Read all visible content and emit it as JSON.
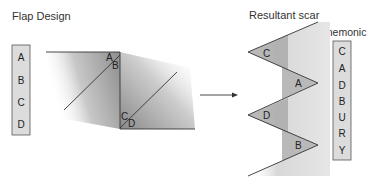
{
  "titles": {
    "flap_design": "Flap Design",
    "resultant_scar": "Resultant scar",
    "mnemonic": "Mnemonic"
  },
  "flap_letters": [
    "A",
    "B",
    "C",
    "D"
  ],
  "flap_labels": {
    "upper_left": "A",
    "upper_right": "B",
    "lower_left": "C",
    "lower_right": "D"
  },
  "scar_labels": [
    "C",
    "A",
    "D",
    "B"
  ],
  "mnemonic_letters": [
    "C",
    "A",
    "D",
    "B",
    "U",
    "R",
    "Y"
  ],
  "colors": {
    "box_fill": "#dcdcdc",
    "flap_shade": "#9a9a9a",
    "line": "#333333"
  }
}
